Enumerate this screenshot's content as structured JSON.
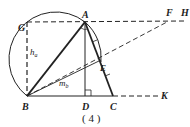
{
  "figure": {
    "caption": "( 4 )",
    "points": {
      "A": "A",
      "B": "B",
      "C": "C",
      "D": "D",
      "E": "E",
      "F": "F",
      "G": "G",
      "H": "H",
      "K": "K"
    },
    "labels": {
      "h_a_main": "h",
      "h_a_sub": "a",
      "m_b_main": "m",
      "m_b_sub": "b"
    },
    "colors": {
      "stroke": "#222222",
      "background": "#ffffff"
    }
  }
}
